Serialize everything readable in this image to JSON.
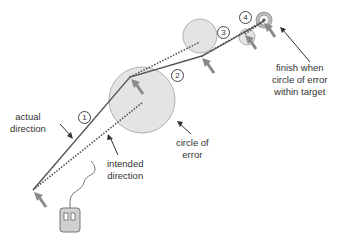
{
  "diagram": {
    "labels": {
      "actual_direction": [
        "actual",
        "direction"
      ],
      "intended_direction": [
        "intended",
        "direction"
      ],
      "circle_of_error": [
        "circle of",
        "error"
      ],
      "finish": [
        "finish when",
        "circle of error",
        "within target"
      ]
    },
    "steps": [
      "1",
      "2",
      "3",
      "4"
    ],
    "colors": {
      "line": "#555555",
      "circle_fill": "#e4e4e4",
      "circle_stroke": "#9a9a9a",
      "arrow": "#8a8a8a",
      "target": "#999999"
    }
  }
}
